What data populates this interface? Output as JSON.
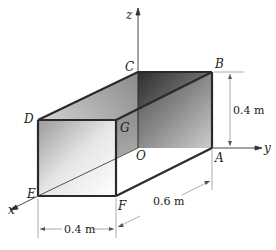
{
  "diagram": {
    "type": "3d-box-frame",
    "axes": {
      "x": "x",
      "y": "y",
      "z": "z"
    },
    "points": {
      "A": "A",
      "B": "B",
      "C": "C",
      "D": "D",
      "E": "E",
      "F": "F",
      "G": "G",
      "O": "O"
    },
    "dimensions": {
      "height": "0.4 m",
      "width": "0.4 m",
      "length": "0.6 m"
    },
    "colors": {
      "edge": "#2a2a2a",
      "face_dark": "#3a3a3a",
      "face_light": "#f2f2f2",
      "dim_line": "#888888"
    }
  }
}
